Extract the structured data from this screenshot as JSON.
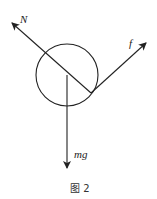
{
  "diagram": {
    "type": "free-body-diagram",
    "caption": "图 2",
    "body": {
      "shape": "circle",
      "cx": 67,
      "cy": 75,
      "r": 31
    },
    "contact_point": {
      "x": 91,
      "y": 93
    },
    "forces": [
      {
        "name": "N",
        "label": "N",
        "from": [
          91,
          93
        ],
        "to": [
          12,
          23
        ]
      },
      {
        "name": "f",
        "label": "f",
        "from": [
          91,
          93
        ],
        "to": [
          146,
          43
        ]
      },
      {
        "name": "mg",
        "label": "mg",
        "from": [
          67,
          75
        ],
        "to": [
          67,
          168
        ]
      }
    ]
  },
  "colors": {
    "stroke": "#222222",
    "background": "#ffffff"
  }
}
